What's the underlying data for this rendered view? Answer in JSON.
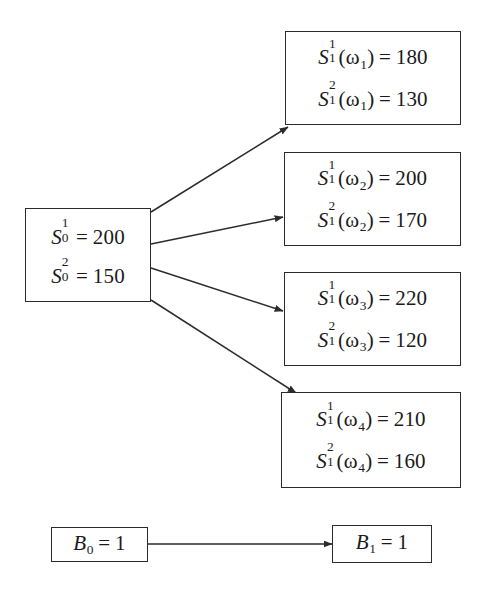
{
  "diagram": {
    "type": "one-period multi-asset binomial/multinomial tree",
    "background_color": "#ffffff",
    "stroke_color": "#2b2b2b"
  },
  "root": {
    "name": "initial-stock-prices",
    "lines": [
      {
        "symbol": "S",
        "sup": "1",
        "sub": "0",
        "arg": "",
        "eq": "=",
        "value": "200"
      },
      {
        "symbol": "S",
        "sup": "2",
        "sub": "0",
        "arg": "",
        "eq": "=",
        "value": "150"
      }
    ]
  },
  "states": [
    {
      "name": "state-omega-1",
      "state_label": "ω1",
      "lines": [
        {
          "symbol": "S",
          "sup": "1",
          "sub": "1",
          "arg": "ω",
          "arg_sub": "1",
          "eq": "=",
          "value": "180"
        },
        {
          "symbol": "S",
          "sup": "2",
          "sub": "1",
          "arg": "ω",
          "arg_sub": "1",
          "eq": "=",
          "value": "130"
        }
      ]
    },
    {
      "name": "state-omega-2",
      "state_label": "ω2",
      "lines": [
        {
          "symbol": "S",
          "sup": "1",
          "sub": "1",
          "arg": "ω",
          "arg_sub": "2",
          "eq": "=",
          "value": "200"
        },
        {
          "symbol": "S",
          "sup": "2",
          "sub": "1",
          "arg": "ω",
          "arg_sub": "2",
          "eq": "=",
          "value": "170"
        }
      ]
    },
    {
      "name": "state-omega-3",
      "state_label": "ω3",
      "lines": [
        {
          "symbol": "S",
          "sup": "1",
          "sub": "1",
          "arg": "ω",
          "arg_sub": "3",
          "eq": "=",
          "value": "220"
        },
        {
          "symbol": "S",
          "sup": "2",
          "sub": "1",
          "arg": "ω",
          "arg_sub": "3",
          "eq": "=",
          "value": "120"
        }
      ]
    },
    {
      "name": "state-omega-4",
      "state_label": "ω4",
      "lines": [
        {
          "symbol": "S",
          "sup": "1",
          "sub": "1",
          "arg": "ω",
          "arg_sub": "4",
          "eq": "=",
          "value": "210"
        },
        {
          "symbol": "S",
          "sup": "2",
          "sub": "1",
          "arg": "ω",
          "arg_sub": "4",
          "eq": "=",
          "value": "160"
        }
      ]
    }
  ],
  "bond": {
    "start": {
      "symbol": "B",
      "sub": "0",
      "eq": "=",
      "value": "1"
    },
    "end": {
      "symbol": "B",
      "sub": "1",
      "eq": "=",
      "value": "1"
    }
  },
  "edges": [
    {
      "name": "edge-root-to-omega-1",
      "from": [
        151,
        212
      ],
      "to": [
        288,
        127
      ]
    },
    {
      "name": "edge-root-to-omega-2",
      "from": [
        151,
        244
      ],
      "to": [
        283,
        217
      ]
    },
    {
      "name": "edge-root-to-omega-3",
      "from": [
        151,
        268
      ],
      "to": [
        283,
        311
      ]
    },
    {
      "name": "edge-root-to-omega-4",
      "from": [
        151,
        300
      ],
      "to": [
        296,
        393
      ]
    },
    {
      "name": "edge-bond-0-to-bond-1",
      "from": [
        148,
        544
      ],
      "to": [
        332,
        544
      ]
    }
  ]
}
